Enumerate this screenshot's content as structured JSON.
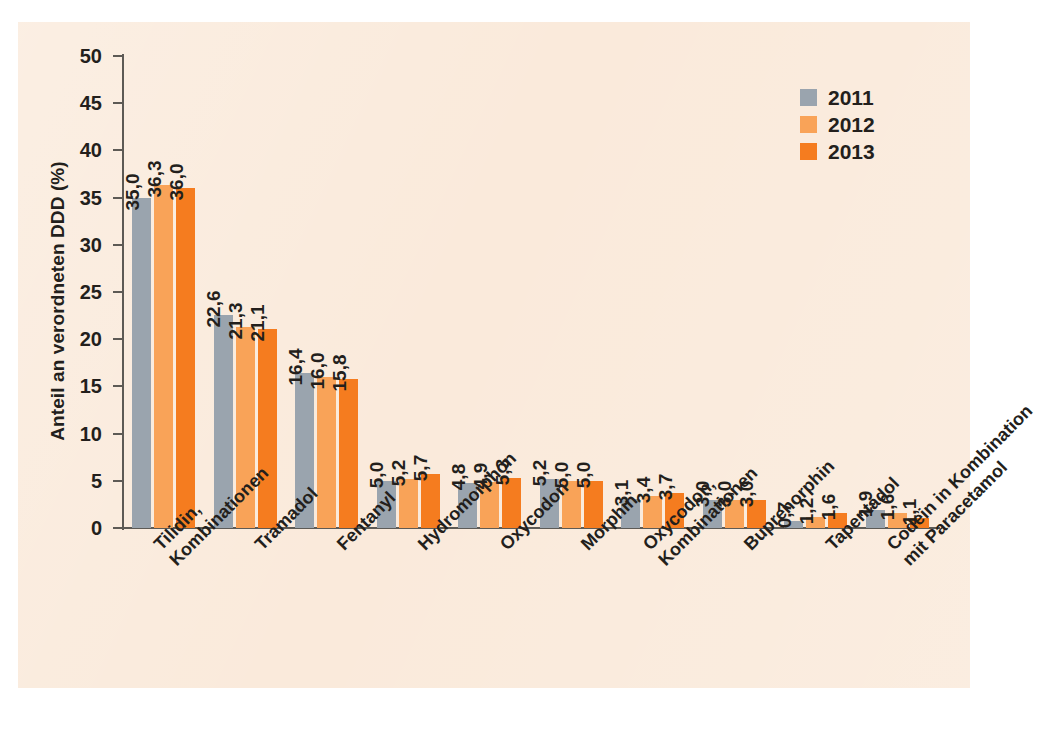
{
  "chart_data": {
    "type": "bar",
    "title": "",
    "xlabel": "",
    "ylabel": "Anteil an verordneten DDD (%)",
    "ylim": [
      0,
      50
    ],
    "yticks": [
      0,
      5,
      10,
      15,
      20,
      25,
      30,
      35,
      40,
      45,
      50
    ],
    "ytick_labels": [
      "0",
      "5",
      "10",
      "15",
      "20",
      "25",
      "30",
      "35",
      "40",
      "45",
      "50"
    ],
    "grid": false,
    "legend_position": "top-right",
    "decimal_separator": ",",
    "categories": [
      "Tilidin,\nKombinationen",
      "Tramadol",
      "Fentanyl",
      "Hydromorphon",
      "Oxycodon",
      "Morphin",
      "Oxycodon,\nKombinationen",
      "Buprenorphin",
      "Tapentadol",
      "Codein in Kombination\nmit Paracetamol"
    ],
    "category_lines": [
      [
        "Tilidin,",
        "Kombinationen"
      ],
      [
        "Tramadol",
        ""
      ],
      [
        "Fentanyl",
        ""
      ],
      [
        "Hydromorphon",
        ""
      ],
      [
        "Oxycodon",
        ""
      ],
      [
        "Morphin",
        ""
      ],
      [
        "Oxycodon,",
        "Kombinationen"
      ],
      [
        "Buprenorphin",
        ""
      ],
      [
        "Tapentadol",
        ""
      ],
      [
        "Codein in Kombination",
        "mit Paracetamol"
      ]
    ],
    "series": [
      {
        "name": "2011",
        "color": "#9aa4ae",
        "values": [
          35.0,
          22.6,
          16.4,
          5.0,
          4.8,
          5.2,
          3.1,
          3.0,
          0.7,
          1.9
        ],
        "labels": [
          "35,0",
          "22,6",
          "16,4",
          "5,0",
          "4,8",
          "5,2",
          "3,1",
          "3,0",
          "0,7",
          "1,9"
        ]
      },
      {
        "name": "2012",
        "color": "#f9a358",
        "values": [
          36.3,
          21.3,
          16.0,
          5.2,
          4.9,
          5.0,
          3.4,
          3.0,
          1.2,
          1.6
        ],
        "labels": [
          "36,3",
          "21,3",
          "16,0",
          "5,2",
          "4,9",
          "5,0",
          "3,4",
          "3,0",
          "1,2",
          "1,6"
        ]
      },
      {
        "name": "2013",
        "color": "#f57c1f",
        "values": [
          36.0,
          21.1,
          15.8,
          5.7,
          5.3,
          5.0,
          3.7,
          3.0,
          1.6,
          1.1
        ],
        "labels": [
          "36,0",
          "21,1",
          "15,8",
          "5,7",
          "5,3",
          "5,0",
          "3,7",
          "3,0",
          "1,6",
          "1,1"
        ]
      }
    ]
  },
  "legend": {
    "items": [
      {
        "label": "2011",
        "color": "#9aa4ae"
      },
      {
        "label": "2012",
        "color": "#f9a358"
      },
      {
        "label": "2013",
        "color": "#f57c1f"
      }
    ]
  },
  "colors": {
    "background": "#faeadb",
    "axis": "#5d5a55",
    "text": "#231f1c",
    "series_2011": "#9aa4ae",
    "series_2012": "#f9a358",
    "series_2013": "#f57c1f"
  }
}
